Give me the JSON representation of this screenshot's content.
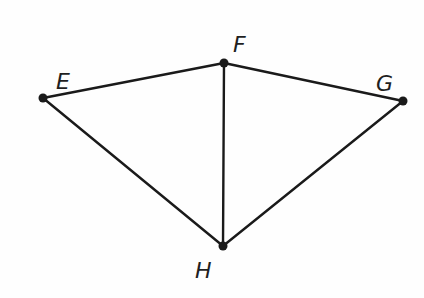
{
  "diagram": {
    "title": "",
    "stroke_color": "#1a1a1a",
    "background": "#fefefe",
    "points": {
      "E": {
        "x": 43,
        "y": 98,
        "label": "E",
        "label_x": 56,
        "label_y": 89
      },
      "F": {
        "x": 224,
        "y": 63,
        "label": "F",
        "label_x": 233,
        "label_y": 52
      },
      "G": {
        "x": 403,
        "y": 101,
        "label": "G",
        "label_x": 376,
        "label_y": 91
      },
      "H": {
        "x": 223,
        "y": 246,
        "label": "H",
        "label_x": 195,
        "label_y": 278
      }
    },
    "segments": [
      {
        "from": "E",
        "to": "F"
      },
      {
        "from": "F",
        "to": "G"
      },
      {
        "from": "E",
        "to": "H"
      },
      {
        "from": "F",
        "to": "H"
      },
      {
        "from": "G",
        "to": "H"
      }
    ]
  }
}
